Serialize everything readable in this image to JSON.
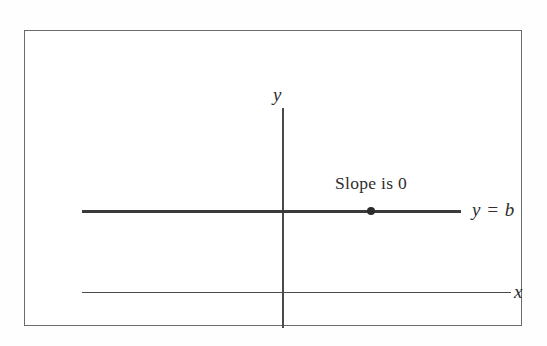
{
  "figure": {
    "frame": {
      "border_color": "#6b6b6b",
      "background_color": "#ffffff"
    },
    "axes": {
      "y_axis_label": "y",
      "x_axis_label": "x",
      "axis_color": "#4a4a4a"
    },
    "line": {
      "equation_label": "y = b",
      "annotation": "Slope is 0",
      "line_color": "#3a3a3a",
      "point_color": "#2b2b2b"
    }
  },
  "chart_data": {
    "type": "line",
    "xlabel": "x",
    "ylabel": "y",
    "grid": false,
    "legend": "none",
    "annotations": [
      {
        "text": "Slope is 0",
        "x": 0.55,
        "y": 1.28
      },
      {
        "text": "y = b",
        "x": 1.18,
        "y": 1.0
      }
    ],
    "series": [
      {
        "name": "y = b",
        "slope": 0,
        "intercept": "b",
        "x": [
          -1.09,
          1.0
        ],
        "values": [
          1.0,
          1.0
        ],
        "style": "thick"
      }
    ],
    "points": [
      {
        "label": "",
        "x": 0.49,
        "y": 1.0
      }
    ],
    "xlim": [
      -1.09,
      1.25
    ],
    "ylim": [
      -0.9,
      2.15
    ]
  }
}
